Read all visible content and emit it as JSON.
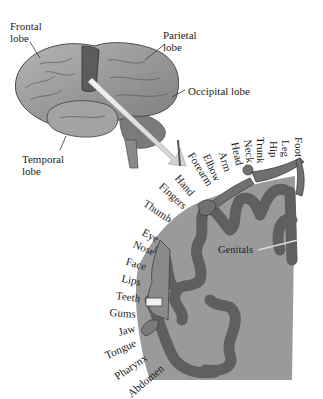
{
  "brain_labels": {
    "frontal": [
      "Frontal",
      "lobe"
    ],
    "parietal": [
      "Parietal",
      "lobe"
    ],
    "occipital": "Occipital lobe",
    "temporal": [
      "Temporal",
      "lobe"
    ]
  },
  "homunculus_labels": [
    {
      "text": "Foot",
      "x": 305,
      "y": 137,
      "rot": 90
    },
    {
      "text": "Leg",
      "x": 292,
      "y": 140,
      "rot": 90
    },
    {
      "text": "Hip",
      "x": 280,
      "y": 141,
      "rot": 90
    },
    {
      "text": "Trunk",
      "x": 267,
      "y": 137,
      "rot": 90
    },
    {
      "text": "Neck",
      "x": 254,
      "y": 139,
      "rot": 84
    },
    {
      "text": "Head",
      "x": 241,
      "y": 141,
      "rot": 78
    },
    {
      "text": "Arm",
      "x": 228,
      "y": 150,
      "rot": 72
    },
    {
      "text": "Elbow",
      "x": 212,
      "y": 152,
      "rot": 66
    },
    {
      "text": "Forearm",
      "x": 196,
      "y": 150,
      "rot": 58
    },
    {
      "text": "Hand",
      "x": 182,
      "y": 172,
      "rot": 50
    },
    {
      "text": "Fingers",
      "x": 165,
      "y": 180,
      "rot": 42
    },
    {
      "text": "Thumb",
      "x": 148,
      "y": 197,
      "rot": 34
    },
    {
      "text": "Eye",
      "x": 146,
      "y": 226,
      "rot": 28
    },
    {
      "text": "Nose",
      "x": 136,
      "y": 238,
      "rot": 22
    },
    {
      "text": "Face",
      "x": 128,
      "y": 255,
      "rot": 16
    },
    {
      "text": "Lips",
      "x": 123,
      "y": 272,
      "rot": 12
    },
    {
      "text": "Teeth",
      "x": 117,
      "y": 289,
      "rot": 8
    },
    {
      "text": "Gums",
      "x": 110,
      "y": 306,
      "rot": 4
    },
    {
      "text": "Jaw",
      "x": 117,
      "y": 326,
      "rot": -14
    },
    {
      "text": "Tongue",
      "x": 103,
      "y": 350,
      "rot": -24
    },
    {
      "text": "Pharynx",
      "x": 112,
      "y": 372,
      "rot": -34
    },
    {
      "text": "Abdomen",
      "x": 125,
      "y": 390,
      "rot": -40
    }
  ],
  "genitals_label": "Genitals",
  "colors": {
    "brain_light": "#a9a9a9",
    "brain_mid": "#8c8c8c",
    "brain_dark": "#5a5a5a",
    "cortex_strip": "#6b6b6b",
    "homunculus": "#6a6a6a",
    "cortex_bg": "#9a9a9a",
    "arrow_fill": "#e6e6e6"
  }
}
